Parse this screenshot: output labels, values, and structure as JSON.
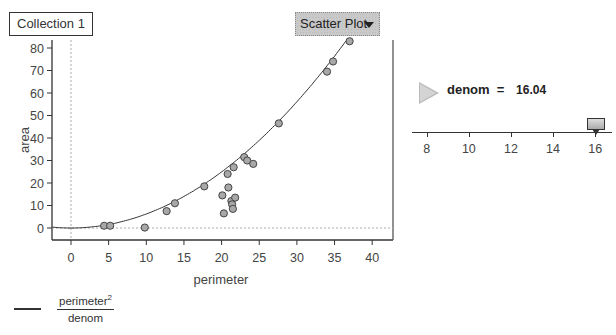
{
  "collection": {
    "label": "Collection 1"
  },
  "plot_type_menu": {
    "selected": "Scatter Plot",
    "icon": "dropdown-triangle-icon"
  },
  "legend": {
    "numerator": "perimeter",
    "exponent": "2",
    "denominator": "denom"
  },
  "slider": {
    "name": "denom",
    "equals": "=",
    "value": "16.04",
    "value_num": 16.04,
    "ticks": [
      "8",
      "10",
      "12",
      "14",
      "16"
    ],
    "range": [
      7.3,
      16.8
    ],
    "icon": "play-animation-icon"
  },
  "chart_data": {
    "type": "scatter",
    "title": "",
    "xlabel": "perimeter",
    "ylabel": "area",
    "xlim": [
      -3,
      42
    ],
    "ylim": [
      -5,
      84
    ],
    "x_ticks": [
      0,
      5,
      10,
      15,
      20,
      25,
      30,
      35,
      40
    ],
    "y_ticks": [
      0,
      10,
      20,
      30,
      40,
      50,
      60,
      70,
      80
    ],
    "grid": false,
    "reference_lines": {
      "x0": true,
      "y0": true,
      "style": "dashed-gray"
    },
    "points": [
      {
        "x": 4.4,
        "y": 1.0
      },
      {
        "x": 5.2,
        "y": 1.0
      },
      {
        "x": 9.8,
        "y": 0.2
      },
      {
        "x": 12.7,
        "y": 7.5
      },
      {
        "x": 13.8,
        "y": 11.0
      },
      {
        "x": 17.7,
        "y": 18.5
      },
      {
        "x": 20.1,
        "y": 14.5
      },
      {
        "x": 20.3,
        "y": 6.5
      },
      {
        "x": 20.8,
        "y": 24.0
      },
      {
        "x": 20.9,
        "y": 18.0
      },
      {
        "x": 21.3,
        "y": 12.0
      },
      {
        "x": 21.4,
        "y": 10.5
      },
      {
        "x": 21.5,
        "y": 8.5
      },
      {
        "x": 21.6,
        "y": 27.0
      },
      {
        "x": 21.8,
        "y": 13.5
      },
      {
        "x": 23.0,
        "y": 31.5
      },
      {
        "x": 23.4,
        "y": 30.0
      },
      {
        "x": 24.2,
        "y": 28.5
      },
      {
        "x": 27.6,
        "y": 46.5
      },
      {
        "x": 34.0,
        "y": 69.5
      },
      {
        "x": 34.8,
        "y": 74.0
      },
      {
        "x": 37.0,
        "y": 83.0
      }
    ],
    "function": {
      "expression": "perimeter^2 / denom",
      "denom": 16.04
    },
    "legend": [
      "perimeter² / denom"
    ]
  }
}
